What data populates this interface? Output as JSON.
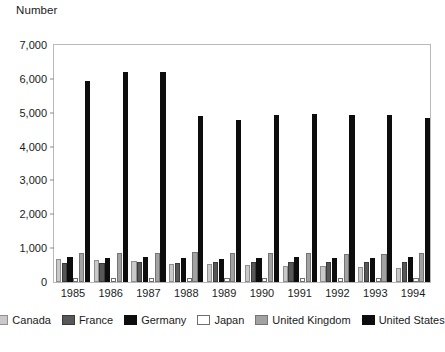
{
  "chart_data": {
    "type": "bar",
    "title": "",
    "ylabel": "Number",
    "xlabel": "",
    "ylim": [
      0,
      7000
    ],
    "ytick_step": 1000,
    "ytick_labels": [
      "0",
      "1,000",
      "2,000",
      "3,000",
      "4,000",
      "5,000",
      "6,000",
      "7,000"
    ],
    "ytick_values": [
      0,
      1000,
      2000,
      3000,
      4000,
      5000,
      6000,
      7000
    ],
    "grid": false,
    "legend_position": "bottom",
    "categories": [
      "1985",
      "1986",
      "1987",
      "1988",
      "1989",
      "1990",
      "1991",
      "1992",
      "1993",
      "1994"
    ],
    "series": [
      {
        "name": "Canada",
        "color": "#c9c9c9",
        "values": [
          660,
          640,
          630,
          540,
          520,
          510,
          480,
          470,
          450,
          420
        ]
      },
      {
        "name": "France",
        "color": "#575757",
        "values": [
          570,
          560,
          590,
          560,
          590,
          600,
          600,
          590,
          600,
          590
        ]
      },
      {
        "name": "Germany",
        "color": "#0d0d0d",
        "values": [
          720,
          710,
          720,
          700,
          680,
          690,
          720,
          700,
          710,
          740
        ]
      },
      {
        "name": "Japan",
        "color": "#ffffff",
        "values": [
          120,
          120,
          120,
          110,
          110,
          110,
          110,
          110,
          110,
          110
        ]
      },
      {
        "name": "United Kingdom",
        "color": "#a2a2a2",
        "values": [
          860,
          850,
          860,
          870,
          840,
          860,
          840,
          830,
          830,
          850
        ]
      },
      {
        "name": "United States",
        "color": "#0d0d0d",
        "values": [
          5900,
          6150,
          6150,
          4870,
          4750,
          4900,
          4920,
          4880,
          4880,
          4790
        ]
      }
    ]
  },
  "legend": {
    "items": [
      {
        "label": "Canada"
      },
      {
        "label": "France"
      },
      {
        "label": "Germany"
      },
      {
        "label": "Japan"
      },
      {
        "label": "United Kingdom"
      },
      {
        "label": "United States"
      }
    ]
  }
}
